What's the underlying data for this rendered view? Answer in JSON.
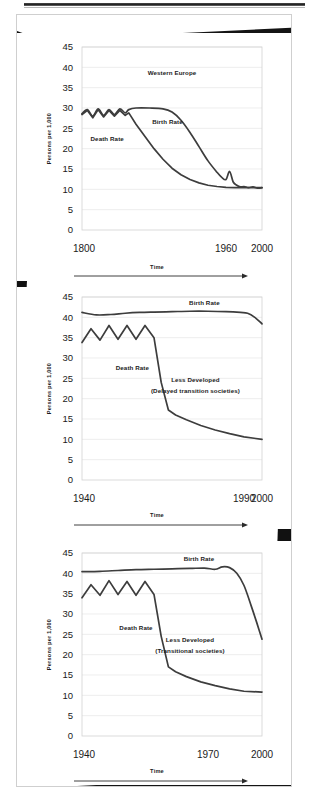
{
  "page": {
    "kind": "scanned-textbook-figure",
    "figure_count": 3
  },
  "common": {
    "ylabel": "Persons per 1,000",
    "xlabel": "Time",
    "birth_label": "Birth Rate",
    "death_label": "Death Rate",
    "yticks": [
      "0",
      "5",
      "10",
      "15",
      "20",
      "25",
      "30",
      "35",
      "40",
      "45"
    ]
  },
  "chart_data": [
    {
      "id": "western-europe",
      "type": "line",
      "title": "Western Europe",
      "xlabel": "Time",
      "ylabel": "Persons per 1,000",
      "ylim": [
        0,
        45
      ],
      "xlim": [
        1800,
        2000
      ],
      "grid": true,
      "legend": "inline-annotations",
      "xticks": [
        "1800",
        "1960",
        "2000"
      ],
      "xtick_values": [
        1800,
        1960,
        2000
      ],
      "yticks": [
        0,
        5,
        10,
        15,
        20,
        25,
        30,
        35,
        40,
        45
      ],
      "annotations": [
        {
          "text": "Western Europe",
          "x": 1900,
          "y": 38
        },
        {
          "text": "Birth Rate",
          "x": 1895,
          "y": 26
        },
        {
          "text": "Death Rate",
          "x": 1828,
          "y": 22
        }
      ],
      "series": [
        {
          "name": "Birth Rate",
          "x": [
            1800,
            1806,
            1812,
            1818,
            1824,
            1830,
            1836,
            1842,
            1848,
            1852,
            1860,
            1875,
            1890,
            1900,
            1910,
            1920,
            1930,
            1940,
            1950,
            1955,
            1960,
            1964,
            1968,
            1972,
            1976,
            1980,
            1985,
            1990,
            1995,
            2000
          ],
          "values": [
            28.6,
            29.6,
            28.0,
            29.8,
            28.2,
            29.6,
            28.4,
            29.8,
            28.8,
            29.6,
            30.0,
            30.0,
            29.8,
            29.0,
            27.0,
            24.0,
            20.5,
            17.0,
            14.2,
            13.0,
            12.4,
            14.4,
            11.8,
            11.0,
            10.6,
            10.7,
            10.4,
            10.6,
            10.3,
            10.4
          ]
        },
        {
          "name": "Death Rate",
          "x": [
            1800,
            1806,
            1812,
            1818,
            1824,
            1830,
            1836,
            1842,
            1848,
            1852,
            1860,
            1870,
            1880,
            1890,
            1900,
            1910,
            1920,
            1930,
            1940,
            1950,
            1960,
            1970,
            1980,
            1990,
            2000
          ],
          "values": [
            28.4,
            29.4,
            27.6,
            29.6,
            27.8,
            29.4,
            28.0,
            29.4,
            28.2,
            28.8,
            26.0,
            23.0,
            20.0,
            17.4,
            15.2,
            13.6,
            12.4,
            11.6,
            11.0,
            10.7,
            10.5,
            10.4,
            10.4,
            10.4,
            10.4
          ]
        }
      ]
    },
    {
      "id": "less-developed-delayed",
      "type": "line",
      "title": "Less Developed (Delayed transition societies)",
      "title_line1": "Less Developed",
      "title_line2": "(Delayed transition societies)",
      "xlabel": "Time",
      "ylabel": "Persons per 1,000",
      "ylim": [
        0,
        45
      ],
      "xlim": [
        1900,
        2000
      ],
      "grid": true,
      "xticks": [
        "1940",
        "1990",
        "2000"
      ],
      "xtick_values": [
        1940,
        1990,
        2000
      ],
      "yticks": [
        0,
        5,
        10,
        15,
        20,
        25,
        30,
        35,
        40,
        45
      ],
      "annotations": [
        {
          "text": "Birth Rate",
          "x": 1968,
          "y": 43
        },
        {
          "text": "Death Rate",
          "x": 1928,
          "y": 27
        },
        {
          "text": "Less Developed",
          "x": 1963,
          "y": 24
        },
        {
          "text": "(Delayed transition societies)",
          "x": 1963,
          "y": 21.5
        }
      ],
      "series": [
        {
          "name": "Birth Rate",
          "x": [
            1900,
            1908,
            1916,
            1924,
            1932,
            1940,
            1950,
            1960,
            1970,
            1980,
            1988,
            1992,
            1996,
            2000
          ],
          "values": [
            41.2,
            40.6,
            40.7,
            41.0,
            41.2,
            41.3,
            41.4,
            41.5,
            41.5,
            41.4,
            41.2,
            41.0,
            40.0,
            38.4
          ]
        },
        {
          "name": "Death Rate",
          "x": [
            1900,
            1905,
            1910,
            1915,
            1920,
            1925,
            1930,
            1935,
            1940,
            1944,
            1948,
            1952,
            1958,
            1966,
            1974,
            1982,
            1990,
            2000
          ],
          "values": [
            33.8,
            37.2,
            34.4,
            38.0,
            34.6,
            38.0,
            34.6,
            38.0,
            35.0,
            24.0,
            17.2,
            16.0,
            14.8,
            13.4,
            12.3,
            11.4,
            10.6,
            10.0
          ]
        }
      ]
    },
    {
      "id": "less-developed-transitional",
      "type": "line",
      "title": "Less Developed (Transitional societies)",
      "title_line1": "Less Developed",
      "title_line2": "(Transitional  societies)",
      "xlabel": "Time",
      "ylabel": "Persons per 1,000",
      "ylim": [
        0,
        45
      ],
      "xlim": [
        1900,
        2000
      ],
      "grid": true,
      "xticks": [
        "1940",
        "1970",
        "2000"
      ],
      "xtick_values": [
        1940,
        1970,
        2000
      ],
      "yticks": [
        0,
        5,
        10,
        15,
        20,
        25,
        30,
        35,
        40,
        45
      ],
      "annotations": [
        {
          "text": "Birth Rate",
          "x": 1965,
          "y": 43
        },
        {
          "text": "Death Rate",
          "x": 1930,
          "y": 26
        },
        {
          "text": "Less Developed",
          "x": 1960,
          "y": 23
        },
        {
          "text": "(Transitional  societies)",
          "x": 1960,
          "y": 20.5
        }
      ],
      "series": [
        {
          "name": "Birth Rate",
          "x": [
            1900,
            1910,
            1920,
            1930,
            1940,
            1950,
            1960,
            1968,
            1974,
            1978,
            1982,
            1986,
            1990,
            1994,
            1997,
            2000
          ],
          "values": [
            40.4,
            40.5,
            40.7,
            40.9,
            41.0,
            41.1,
            41.2,
            41.3,
            41.0,
            41.6,
            41.4,
            40.0,
            37.0,
            32.0,
            28.0,
            23.8
          ]
        },
        {
          "name": "Death Rate",
          "x": [
            1900,
            1905,
            1910,
            1915,
            1920,
            1925,
            1930,
            1935,
            1940,
            1944,
            1948,
            1952,
            1958,
            1966,
            1974,
            1982,
            1990,
            2000
          ],
          "values": [
            34.0,
            37.2,
            34.6,
            38.2,
            34.8,
            38.0,
            34.6,
            38.0,
            34.8,
            24.5,
            17.0,
            15.8,
            14.6,
            13.3,
            12.4,
            11.6,
            11.0,
            10.8
          ]
        }
      ]
    }
  ]
}
